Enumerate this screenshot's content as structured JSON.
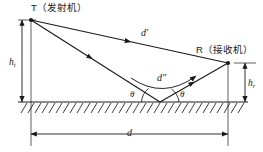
{
  "figure": {
    "type": "diagram",
    "labels": {
      "transmitter": "T（发射机）",
      "receiver": "R（接收机）",
      "transmitter_height": "h",
      "transmitter_height_sub": "t",
      "receiver_height": "h",
      "receiver_height_sub": "r",
      "direct_path": "d′",
      "reflected_path": "d″",
      "grazing_angle_left": "θ",
      "grazing_angle_right": "θ",
      "separation": "d"
    },
    "geometry": {
      "transmitter_point": [
        31,
        20
      ],
      "receiver_point": [
        228,
        63
      ],
      "reflection_point": [
        160,
        102
      ],
      "ground_y": 102,
      "ground_x_start": 18,
      "ground_x_end": 248,
      "left_dim_x": 31,
      "left_dim_top": 20,
      "left_dim_bottom": 102,
      "right_dim_x": 243,
      "right_dim_top": 63,
      "right_dim_bottom": 102,
      "bottom_dim_y": 134,
      "bottom_dim_x_start": 31,
      "bottom_dim_x_end": 228
    },
    "colors": {
      "stroke": "#1a1a1a",
      "background": "#ffffff",
      "hatch": "#1a1a1a"
    }
  }
}
